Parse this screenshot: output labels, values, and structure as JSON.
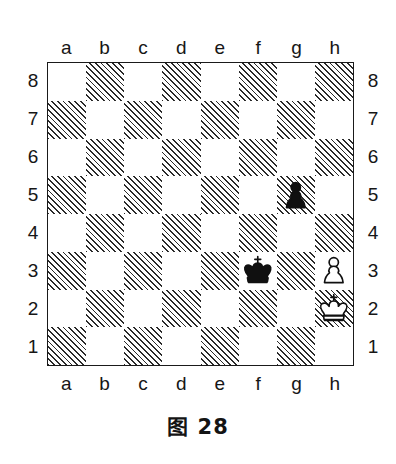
{
  "figure": {
    "caption": "图 28",
    "board_border_color": "#1a1a1a",
    "dark_square_style": "diagonal-hatch",
    "dark_square_color": "#2a2a2a",
    "light_square_color": "#ffffff"
  },
  "coordinates": {
    "files": [
      "a",
      "b",
      "c",
      "d",
      "e",
      "f",
      "g",
      "h"
    ],
    "ranks": [
      "8",
      "7",
      "6",
      "5",
      "4",
      "3",
      "2",
      "1"
    ],
    "files_top": [
      "a",
      "b",
      "c",
      "d",
      "e",
      "f",
      "g",
      "h"
    ],
    "files_bottom": [
      "a",
      "b",
      "c",
      "d",
      "e",
      "f",
      "g",
      "h"
    ],
    "ranks_left": [
      "8",
      "7",
      "6",
      "5",
      "4",
      "3",
      "2",
      "1"
    ],
    "ranks_right": [
      "8",
      "7",
      "6",
      "5",
      "4",
      "3",
      "2",
      "1"
    ]
  },
  "chart_data": {
    "type": "table",
    "title": "图 28",
    "subtitle": "",
    "xlabel": "",
    "ylabel": "",
    "board": {
      "files": [
        "a",
        "b",
        "c",
        "d",
        "e",
        "f",
        "g",
        "h"
      ],
      "ranks": [
        8,
        7,
        6,
        5,
        4,
        3,
        2,
        1
      ],
      "orientation": "white-bottom",
      "square_pattern": "a8 light; dark squares are hatched"
    },
    "pieces": [
      {
        "square": "g5",
        "color": "black",
        "type": "pawn",
        "glyph": "♟",
        "file_index": 6,
        "rank_index": 3
      },
      {
        "square": "f3",
        "color": "black",
        "type": "king",
        "glyph": "♚",
        "file_index": 5,
        "rank_index": 5
      },
      {
        "square": "h3",
        "color": "white",
        "type": "pawn",
        "glyph": "♙",
        "file_index": 7,
        "rank_index": 5
      },
      {
        "square": "h2",
        "color": "white",
        "type": "king",
        "glyph": "♔",
        "file_index": 7,
        "rank_index": 6
      }
    ],
    "piece_count": 4,
    "white_pieces": [
      "Kh2",
      "Ph3"
    ],
    "black_pieces": [
      "Kf3",
      "Pg5"
    ]
  }
}
